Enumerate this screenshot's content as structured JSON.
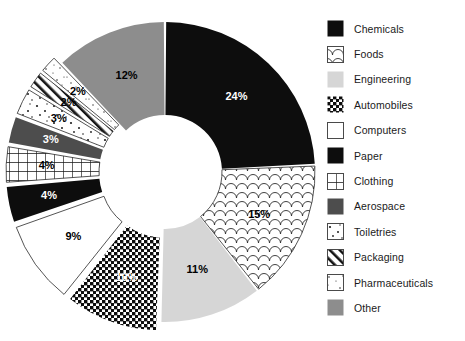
{
  "chart_data": {
    "type": "pie",
    "variant": "donut",
    "title": "",
    "subtitle": "",
    "xlabel": "",
    "ylabel": "",
    "legend_position": "right",
    "grid": false,
    "start_angle_deg": 0,
    "direction": "clockwise",
    "total": 100,
    "units": "percent",
    "categories": [
      "Chemicals",
      "Foods",
      "Engineering",
      "Automobiles",
      "Computers",
      "Paper",
      "Clothing",
      "Aerospace",
      "Toiletries",
      "Packaging",
      "Pharmaceuticals",
      "Other"
    ],
    "values": [
      24,
      15,
      11,
      10,
      9,
      4,
      4,
      3,
      3,
      2,
      2,
      12
    ],
    "data_labels": [
      "24%",
      "15%",
      "11%",
      "10%",
      "9%",
      "4%",
      "4%",
      "3%",
      "3%",
      "2%",
      "2%",
      "12%"
    ],
    "slices": [
      {
        "label": "Chemicals",
        "value": 24,
        "data_label": "24%",
        "fill": "solid-black",
        "color": "#0d0d0d",
        "label_color": "#ffffff",
        "exploded": false
      },
      {
        "label": "Foods",
        "value": 15,
        "data_label": "15%",
        "fill": "fish-scale",
        "color": "#ffffff",
        "label_color": "#000000",
        "exploded": false
      },
      {
        "label": "Engineering",
        "value": 11,
        "data_label": "11%",
        "fill": "light-gray",
        "color": "#d4d4d4",
        "label_color": "#000000",
        "exploded": false
      },
      {
        "label": "Automobiles",
        "value": 10,
        "data_label": "10%",
        "fill": "checkerboard",
        "color": "#111111",
        "label_color": "#ffffff",
        "exploded": true
      },
      {
        "label": "Computers",
        "value": 9,
        "data_label": "9%",
        "fill": "white",
        "color": "#ffffff",
        "label_color": "#000000",
        "exploded": true
      },
      {
        "label": "Paper",
        "value": 4,
        "data_label": "4%",
        "fill": "solid-black",
        "color": "#0d0d0d",
        "label_color": "#ffffff",
        "exploded": true
      },
      {
        "label": "Clothing",
        "value": 4,
        "data_label": "4%",
        "fill": "grid",
        "color": "#ffffff",
        "label_color": "#000000",
        "exploded": true
      },
      {
        "label": "Aerospace",
        "value": 3,
        "data_label": "3%",
        "fill": "dark-gray",
        "color": "#4a4a4a",
        "label_color": "#ffffff",
        "exploded": true
      },
      {
        "label": "Toiletries",
        "value": 3,
        "data_label": "3%",
        "fill": "sparse-dots",
        "color": "#ffffff",
        "label_color": "#000000",
        "exploded": true
      },
      {
        "label": "Packaging",
        "value": 2,
        "data_label": "2%",
        "fill": "diagonal",
        "color": "#ffffff",
        "label_color": "#000000",
        "exploded": true
      },
      {
        "label": "Pharmaceuticals",
        "value": 2,
        "data_label": "2%",
        "fill": "speckle",
        "color": "#ffffff",
        "label_color": "#000000",
        "exploded": true
      },
      {
        "label": "Other",
        "value": 12,
        "data_label": "12%",
        "fill": "mid-gray",
        "color": "#8c8c8c",
        "label_color": "#000000",
        "exploded": false
      }
    ]
  },
  "legend": {
    "items": [
      {
        "label": "Chemicals",
        "fill": "solid-black"
      },
      {
        "label": "Foods",
        "fill": "fish-scale"
      },
      {
        "label": "Engineering",
        "fill": "light-gray"
      },
      {
        "label": "Automobiles",
        "fill": "checkerboard"
      },
      {
        "label": "Computers",
        "fill": "white"
      },
      {
        "label": "Paper",
        "fill": "solid-black"
      },
      {
        "label": "Clothing",
        "fill": "grid"
      },
      {
        "label": "Aerospace",
        "fill": "dark-gray"
      },
      {
        "label": "Toiletries",
        "fill": "sparse-dots"
      },
      {
        "label": "Packaging",
        "fill": "diagonal"
      },
      {
        "label": "Pharmaceuticals",
        "fill": "speckle"
      },
      {
        "label": "Other",
        "fill": "mid-gray"
      }
    ]
  },
  "colors": {
    "background": "#ffffff",
    "text": "#1a1a1a",
    "black": "#0d0d0d",
    "dark_gray": "#4a4a4a",
    "mid_gray": "#8c8c8c",
    "light_gray": "#d4d4d4"
  }
}
